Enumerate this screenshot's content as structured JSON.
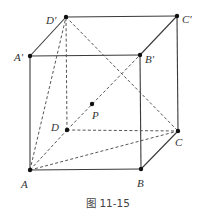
{
  "figure": {
    "caption": "图 11-15",
    "type": "cube-perspective"
  },
  "vertices": {
    "A": {
      "label": "A",
      "x": 30,
      "y": 170,
      "lx": 21,
      "ly": 188
    },
    "B": {
      "label": "B",
      "x": 141,
      "y": 169,
      "lx": 137,
      "ly": 187
    },
    "C": {
      "label": "C",
      "x": 178,
      "y": 131,
      "lx": 175,
      "ly": 146
    },
    "D": {
      "label": "D",
      "x": 67,
      "y": 130,
      "lx": 51,
      "ly": 131
    },
    "A1": {
      "label": "A′",
      "x": 30,
      "y": 56,
      "lx": 14,
      "ly": 61
    },
    "B1": {
      "label": "B′",
      "x": 140,
      "y": 55,
      "lx": 145,
      "ly": 63
    },
    "C1": {
      "label": "C′",
      "x": 177,
      "y": 16,
      "lx": 182,
      "ly": 23
    },
    "D1": {
      "label": "D′",
      "x": 66,
      "y": 17,
      "lx": 46,
      "ly": 24
    },
    "P": {
      "label": "P",
      "x": 92,
      "y": 104,
      "lx": 92,
      "ly": 119
    }
  },
  "solid_edges": [
    [
      "A",
      "B"
    ],
    [
      "B",
      "C"
    ],
    [
      "A",
      "A1"
    ],
    [
      "B",
      "B1"
    ],
    [
      "C",
      "C1"
    ],
    [
      "A1",
      "B1"
    ],
    [
      "B1",
      "C1"
    ],
    [
      "C1",
      "D1"
    ],
    [
      "D1",
      "A1"
    ]
  ],
  "dashed_edges": [
    [
      "A",
      "D"
    ],
    [
      "D",
      "C"
    ],
    [
      "D",
      "D1"
    ],
    [
      "A",
      "C"
    ],
    [
      "A",
      "D1"
    ],
    [
      "D1",
      "C"
    ],
    [
      "D",
      "B1"
    ]
  ]
}
